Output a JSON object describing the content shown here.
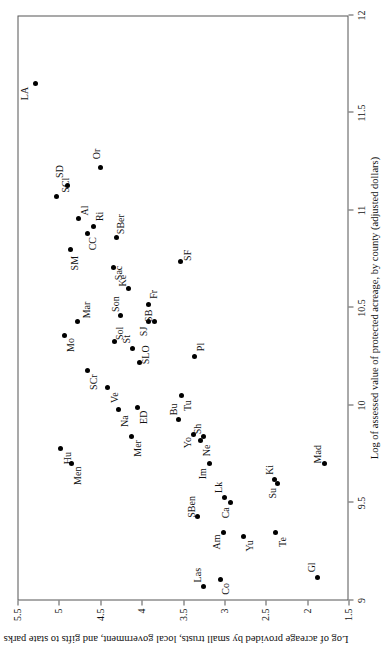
{
  "figure": {
    "rotation_deg": -90,
    "background": "#ffffff",
    "axis_color": "#555555",
    "marker_color": "#000000"
  },
  "chart_data": {
    "type": "scatter",
    "title": "",
    "xlabel": "Log of assessed value of protected acreage, by county (adjusted dollars)",
    "ylabel": "Log of acreage provided by small trusts, local government, and gifts to state parks",
    "xlim": [
      9,
      12
    ],
    "ylim": [
      1.5,
      5.5
    ],
    "xticks": [
      9,
      9.5,
      10,
      10.5,
      11,
      11.5,
      12
    ],
    "xticklabels": [
      "9",
      "9.5",
      "10",
      "10.5",
      "11",
      "11.5",
      "12"
    ],
    "yticks": [
      1.5,
      2,
      2.5,
      3,
      3.5,
      4,
      4.5,
      5,
      5.5
    ],
    "yticklabels": [
      "1.5",
      "2",
      "2.5",
      "3",
      "3.5",
      "4",
      "4.5",
      "5",
      "5.5"
    ],
    "grid": false,
    "legend": false,
    "points": [
      {
        "label": "LA",
        "x": 11.65,
        "y": 5.28,
        "lx": 11.6,
        "ly": 5.41
      },
      {
        "label": "SCl",
        "x": 11.07,
        "y": 5.03,
        "lx": 11.13,
        "ly": 4.92
      },
      {
        "label": "SD",
        "x": 11.13,
        "y": 4.9,
        "lx": 11.2,
        "ly": 4.99
      },
      {
        "label": "Or",
        "x": 11.22,
        "y": 4.5,
        "lx": 11.29,
        "ly": 4.55
      },
      {
        "label": "Al",
        "x": 10.96,
        "y": 4.76,
        "lx": 11.0,
        "ly": 4.69
      },
      {
        "label": "Ri",
        "x": 10.92,
        "y": 4.58,
        "lx": 10.97,
        "ly": 4.51
      },
      {
        "label": "CC",
        "x": 10.88,
        "y": 4.65,
        "lx": 10.83,
        "ly": 4.59
      },
      {
        "label": "SBer",
        "x": 10.86,
        "y": 4.3,
        "lx": 10.93,
        "ly": 4.25
      },
      {
        "label": "SM",
        "x": 10.8,
        "y": 4.86,
        "lx": 10.73,
        "ly": 4.81
      },
      {
        "label": "Sac",
        "x": 10.71,
        "y": 4.34,
        "lx": 10.68,
        "ly": 4.28
      },
      {
        "label": "SF",
        "x": 10.74,
        "y": 3.53,
        "lx": 10.77,
        "ly": 3.45
      },
      {
        "label": "Ke",
        "x": 10.6,
        "y": 4.16,
        "lx": 10.64,
        "ly": 4.23
      },
      {
        "label": "Mar",
        "x": 10.43,
        "y": 4.78,
        "lx": 10.49,
        "ly": 4.67
      },
      {
        "label": "Son",
        "x": 10.46,
        "y": 4.26,
        "lx": 10.52,
        "ly": 4.32
      },
      {
        "label": "Mo",
        "x": 10.36,
        "y": 4.93,
        "lx": 10.31,
        "ly": 4.86
      },
      {
        "label": "Sol",
        "x": 10.33,
        "y": 4.33,
        "lx": 10.37,
        "ly": 4.27
      },
      {
        "label": "Fr",
        "x": 10.52,
        "y": 3.92,
        "lx": 10.57,
        "ly": 3.86
      },
      {
        "label": "SJ",
        "x": 10.43,
        "y": 3.92,
        "lx": 10.38,
        "ly": 3.98
      },
      {
        "label": "SB",
        "x": 10.43,
        "y": 3.85,
        "lx": 10.46,
        "ly": 3.92
      },
      {
        "label": "St",
        "x": 10.29,
        "y": 4.11,
        "lx": 10.34,
        "ly": 4.18
      },
      {
        "label": "SLO",
        "x": 10.22,
        "y": 4.03,
        "lx": 10.26,
        "ly": 3.95
      },
      {
        "label": "SCr",
        "x": 10.18,
        "y": 4.65,
        "lx": 10.12,
        "ly": 4.58
      },
      {
        "label": "Ve",
        "x": 10.09,
        "y": 4.41,
        "lx": 10.04,
        "ly": 4.33
      },
      {
        "label": "Pl",
        "x": 10.25,
        "y": 3.36,
        "lx": 10.3,
        "ly": 3.29
      },
      {
        "label": "Tu",
        "x": 10.05,
        "y": 3.52,
        "lx": 10.0,
        "ly": 3.45
      },
      {
        "label": "Na",
        "x": 9.98,
        "y": 4.28,
        "lx": 9.92,
        "ly": 4.21
      },
      {
        "label": "ED",
        "x": 9.99,
        "y": 4.05,
        "lx": 9.94,
        "ly": 3.98
      },
      {
        "label": "Bu",
        "x": 9.93,
        "y": 3.56,
        "lx": 9.98,
        "ly": 3.62
      },
      {
        "label": "Yo",
        "x": 9.85,
        "y": 3.37,
        "lx": 9.81,
        "ly": 3.44
      },
      {
        "label": "Ne",
        "x": 9.82,
        "y": 3.29,
        "lx": 9.77,
        "ly": 3.22
      },
      {
        "label": "Sh",
        "x": 9.84,
        "y": 3.25,
        "lx": 9.88,
        "ly": 3.32
      },
      {
        "label": "Mer",
        "x": 9.84,
        "y": 4.12,
        "lx": 9.78,
        "ly": 4.05
      },
      {
        "label": "Hu",
        "x": 9.78,
        "y": 4.98,
        "lx": 9.73,
        "ly": 4.9
      },
      {
        "label": "Men",
        "x": 9.7,
        "y": 4.85,
        "lx": 9.64,
        "ly": 4.77
      },
      {
        "label": "Im",
        "x": 9.7,
        "y": 3.18,
        "lx": 9.65,
        "ly": 3.26
      },
      {
        "label": "SBen",
        "x": 9.43,
        "y": 3.32,
        "lx": 9.48,
        "ly": 3.4
      },
      {
        "label": "Lk",
        "x": 9.53,
        "y": 3.0,
        "lx": 9.58,
        "ly": 3.07
      },
      {
        "label": "Ca",
        "x": 9.5,
        "y": 2.92,
        "lx": 9.45,
        "ly": 2.99
      },
      {
        "label": "Ki",
        "x": 9.62,
        "y": 2.39,
        "lx": 9.67,
        "ly": 2.45
      },
      {
        "label": "Su",
        "x": 9.6,
        "y": 2.36,
        "lx": 9.55,
        "ly": 2.42
      },
      {
        "label": "Am",
        "x": 9.35,
        "y": 3.01,
        "lx": 9.3,
        "ly": 3.09
      },
      {
        "label": "Yu",
        "x": 9.33,
        "y": 2.77,
        "lx": 9.28,
        "ly": 2.7
      },
      {
        "label": "Te",
        "x": 9.35,
        "y": 2.38,
        "lx": 9.3,
        "ly": 2.3
      },
      {
        "label": "Mad",
        "x": 9.7,
        "y": 1.79,
        "lx": 9.75,
        "ly": 1.87
      },
      {
        "label": "Las",
        "x": 9.07,
        "y": 3.25,
        "lx": 9.13,
        "ly": 3.32
      },
      {
        "label": "Co",
        "x": 9.11,
        "y": 3.05,
        "lx": 9.06,
        "ly": 2.99
      },
      {
        "label": "Gl",
        "x": 9.12,
        "y": 1.88,
        "lx": 9.17,
        "ly": 1.95
      }
    ]
  }
}
